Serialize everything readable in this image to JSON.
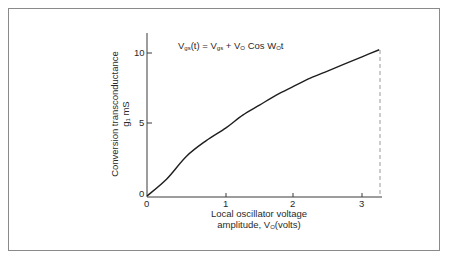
{
  "chart_data": {
    "type": "line",
    "title": "",
    "annotation": "Vgs(t) = Vgs + VO Cos WO t",
    "annotation_parts": {
      "lhs_main": "V",
      "lhs_sub": "gs",
      "lhs_tail": "(t) = ",
      "t1_main": "V",
      "t1_sub": "gs",
      "plus": " + ",
      "t2_main": "V",
      "t2_sub": "O",
      "cos": " Cos ",
      "t3_main": "W",
      "t3_sub": "O",
      "t3_tail": "t"
    },
    "xlabel": "Local oscillator voltage amplitude, VO(volts)",
    "xlabel_line1": "Local oscillator voltage",
    "xlabel_line2_main": "amplitude, V",
    "xlabel_line2_sub": "O",
    "xlabel_line2_tail": "(volts)",
    "ylabel": "Conversion transconductance gc mS",
    "ylabel_line1": "Conversion transconductance",
    "ylabel_line2": "g₁ mS",
    "xticks": [
      "0",
      "1",
      "2",
      "3"
    ],
    "yticks": [
      "0",
      "5",
      "10"
    ],
    "xlim": [
      0,
      3.25
    ],
    "ylim": [
      0,
      11
    ],
    "grid": false,
    "legend": null,
    "series": [
      {
        "name": "conversion transconductance",
        "x": [
          0,
          0.25,
          0.5,
          0.75,
          1.0,
          1.25,
          1.5,
          1.75,
          2.0,
          2.25,
          2.5,
          2.75,
          3.0,
          3.25
        ],
        "y": [
          0,
          1.2,
          2.8,
          3.9,
          4.8,
          5.7,
          6.4,
          7.1,
          7.7,
          8.3,
          8.8,
          9.3,
          9.8,
          10.3
        ]
      }
    ],
    "dashed_marker": {
      "x": 3.25,
      "y": 10.3,
      "style": "vertical dashed line to x-axis"
    }
  },
  "colors": {
    "line": "#1e1e1e",
    "axis": "#3a3a3a",
    "frame": "#8a8a8a",
    "dash": "#9a9a9a"
  }
}
